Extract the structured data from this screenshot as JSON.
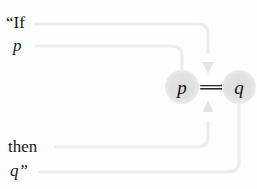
{
  "figure": {
    "name": "conditional-statement-mapping",
    "background_color": "#fefefe",
    "wire_color": "#ededed",
    "arrow_color": "#e4e4e4",
    "node_fill": "#e2e2e2",
    "text_color": "#17171a"
  },
  "statement": {
    "line1": "“If",
    "line2": "p",
    "line3": "then",
    "line4": "q”"
  },
  "formula": {
    "antecedent": "p",
    "operator": "⟹",
    "operator_name": "double-right-arrow-implies",
    "consequent": "q"
  },
  "connectors": [
    {
      "id": "if-to-implies",
      "from": "line1",
      "to": "operator",
      "direction": "down"
    },
    {
      "id": "p-to-p-node",
      "from": "line2",
      "to": "antecedent",
      "direction": "down"
    },
    {
      "id": "then-to-implies",
      "from": "line3",
      "to": "operator",
      "direction": "up"
    },
    {
      "id": "q-to-q-node",
      "from": "line4",
      "to": "consequent",
      "direction": "up"
    }
  ]
}
